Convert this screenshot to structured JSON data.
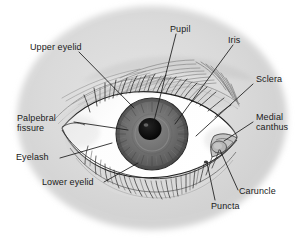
{
  "figure": {
    "type": "labeled-anatomical-diagram",
    "width": 307,
    "height": 250,
    "background_color": "#ffffff",
    "skin_color": "#d9d9d9",
    "sclera_color": "#ffffff",
    "iris_color": "#6e6e6e",
    "pupil_color": "#111111",
    "line_color": "#1a1a1a"
  },
  "labels": [
    {
      "id": "upper-eyelid",
      "text": "Upper eyelid",
      "lines": [
        "Upper eyelid"
      ]
    },
    {
      "id": "pupil",
      "text": "Pupil",
      "lines": [
        "Pupil"
      ]
    },
    {
      "id": "iris",
      "text": "Iris",
      "lines": [
        "Iris"
      ]
    },
    {
      "id": "sclera",
      "text": "Sclera",
      "lines": [
        "Sclera"
      ]
    },
    {
      "id": "medial-canthus",
      "text": "Medial canthus",
      "lines": [
        "Medial",
        "canthus"
      ]
    },
    {
      "id": "palpebral-fissure",
      "text": "Palpebral fissure",
      "lines": [
        "Palpebral",
        "fissure"
      ]
    },
    {
      "id": "eyelash",
      "text": "Eyelash",
      "lines": [
        "Eyelash"
      ]
    },
    {
      "id": "lower-eyelid",
      "text": "Lower eyelid",
      "lines": [
        "Lower eyelid"
      ]
    },
    {
      "id": "puncta",
      "text": "Puncta",
      "lines": [
        "Puncta"
      ]
    },
    {
      "id": "caruncle",
      "text": "Caruncle",
      "lines": [
        "Caruncle"
      ]
    }
  ],
  "label_text": {
    "upper_eyelid": "Upper eyelid",
    "pupil": "Pupil",
    "iris": "Iris",
    "sclera": "Sclera",
    "medial_canthus_1": "Medial",
    "medial_canthus_2": "canthus",
    "palpebral_fissure_1": "Palpebral",
    "palpebral_fissure_2": "fissure",
    "eyelash": "Eyelash",
    "lower_eyelid": "Lower eyelid",
    "puncta": "Puncta",
    "caruncle": "Caruncle"
  }
}
